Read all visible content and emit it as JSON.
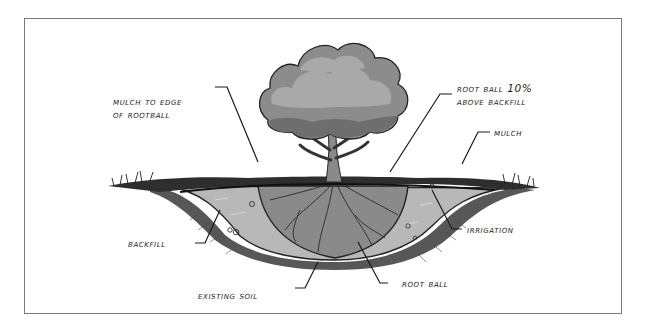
{
  "diagram": {
    "labels": {
      "mulch_edge_line1": "Mulch to Edge",
      "mulch_edge_line2": "of Rootball",
      "rootball_above_line1": "Root Ball 10%",
      "rootball_above_line2": "Above Backfill",
      "mulch": "Mulch",
      "backfill": "Backfill",
      "irrigation": "Irrigation",
      "root_ball": "Root Ball",
      "existing_soil": "Existing Soil"
    },
    "colors": {
      "frame": "#7a7a7a",
      "canopy_light": "#a9a9a9",
      "canopy_mid": "#8c8c8c",
      "canopy_dark": "#6e6e6e",
      "backfill": "#b8b8b8",
      "rootball": "#8a8a8a",
      "mulch": "#2e2e2e",
      "ink": "#1a1a1a"
    }
  }
}
